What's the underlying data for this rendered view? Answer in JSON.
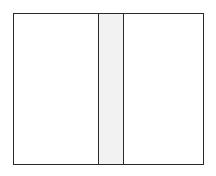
{
  "diagram": {
    "type": "partitioned-rectangle",
    "regions": [
      {
        "id": "left",
        "label": "",
        "fill": "#ffffff"
      },
      {
        "id": "middle",
        "label": "",
        "fill": "#f2f2f2"
      },
      {
        "id": "right",
        "label": "",
        "fill": "#ffffff"
      }
    ],
    "stroke_color": "#2a2a2a"
  }
}
